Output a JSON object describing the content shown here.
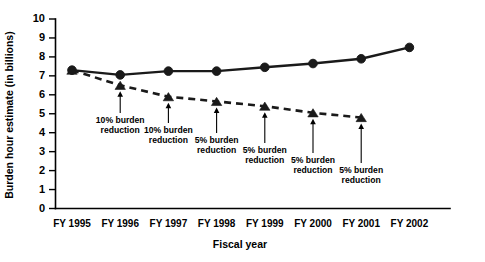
{
  "chart_data": {
    "type": "line",
    "title": "",
    "xlabel": "Fiscal year",
    "ylabel": "Burden hour estimate (in billions)",
    "categories": [
      "FY 1995",
      "FY 1996",
      "FY 1997",
      "FY 1998",
      "FY 1999",
      "FY 2000",
      "FY 2001",
      "FY 2002"
    ],
    "ylim": [
      0,
      10
    ],
    "yticks": [
      "0",
      "1",
      "2",
      "3",
      "4",
      "5",
      "6",
      "7",
      "8",
      "9",
      "10"
    ],
    "grid": false,
    "legend": "none",
    "series": [
      {
        "name": "Actual burden hour estimate",
        "style": "solid",
        "marker": "circle",
        "values": [
          7.3,
          7.05,
          7.25,
          7.25,
          7.45,
          7.65,
          7.9,
          8.5
        ]
      },
      {
        "name": "Goal with reductions",
        "style": "dashed",
        "marker": "triangle",
        "values": [
          7.3,
          6.5,
          5.9,
          5.65,
          5.4,
          5.05,
          4.8,
          null
        ]
      }
    ],
    "annotations": [
      {
        "category": "FY 1996",
        "value": 6.5,
        "line1": "10% burden",
        "line2": "reduction"
      },
      {
        "category": "FY 1997",
        "value": 5.9,
        "line1": "10% burden",
        "line2": "reduction"
      },
      {
        "category": "FY 1998",
        "value": 5.65,
        "line1": "5% burden",
        "line2": "reduction"
      },
      {
        "category": "FY 1999",
        "value": 5.4,
        "line1": "5% burden",
        "line2": "reduction"
      },
      {
        "category": "FY 2000",
        "value": 5.05,
        "line1": "5% burden",
        "line2": "reduction"
      },
      {
        "category": "FY 2001",
        "value": 4.8,
        "line1": "5% burden",
        "line2": "reduction"
      }
    ],
    "colors": {
      "ink": "#1a1a1a",
      "axis": "#000000",
      "background": "#ffffff"
    }
  }
}
